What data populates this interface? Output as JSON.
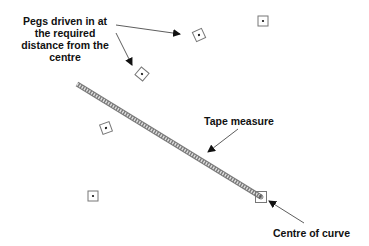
{
  "diagram": {
    "labels": {
      "pegs": [
        "Pegs driven in at",
        "the required",
        "distance from the",
        "centre"
      ],
      "tape": "Tape measure",
      "centre": "Centre of curve"
    },
    "colors": {
      "text": "#111111",
      "arrow": "#333333",
      "peg_outline": "#777777",
      "tape": "#888888"
    },
    "pegs": [
      {
        "x": 263,
        "y": 21,
        "rotation": 0
      },
      {
        "x": 199,
        "y": 35,
        "rotation": -25
      },
      {
        "x": 142,
        "y": 74,
        "rotation": 40
      },
      {
        "x": 106,
        "y": 128,
        "rotation": -20
      },
      {
        "x": 93,
        "y": 196,
        "rotation": 0
      }
    ],
    "centre": {
      "x": 261,
      "y": 197
    },
    "tape_start": {
      "x": 77,
      "y": 84
    }
  }
}
